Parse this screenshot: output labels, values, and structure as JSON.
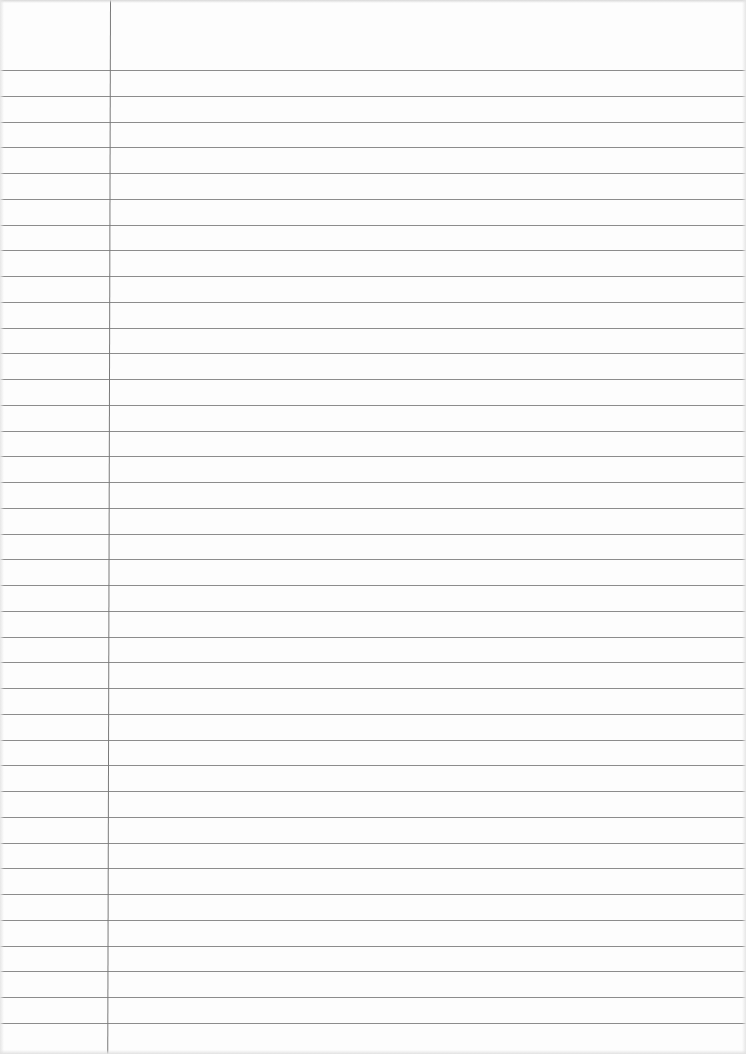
{
  "document": {
    "type": "lined-paper",
    "width": 746,
    "height": 1054,
    "header_height": 69,
    "first_rule_y": 70,
    "rule_spacing": 25.75,
    "rule_count": 38,
    "margin_line_x": 110,
    "colors": {
      "paper": "#fdfdfd",
      "rule": "#8c8c8c",
      "margin_line": "#7a7a7a"
    }
  }
}
